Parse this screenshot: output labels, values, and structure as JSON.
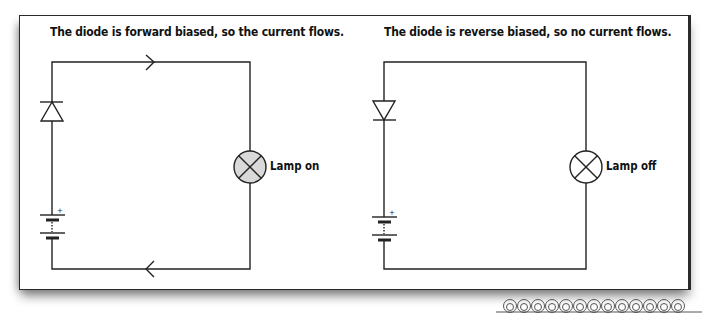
{
  "panels": [
    {
      "caption": "The diode is forward biased, so the current flows.",
      "diode_orientation": "forward",
      "lamp_label": "Lamp on",
      "lamp_state": "on",
      "lamp_fill": "#d9d9d9",
      "current_arrows": [
        "right-on-top-wire",
        "left-on-bottom-wire"
      ]
    },
    {
      "caption": "The diode is reverse biased, so no current flows.",
      "diode_orientation": "reverse",
      "lamp_label": "Lamp off",
      "lamp_state": "off",
      "lamp_fill": "#ffffff",
      "current_arrows": []
    }
  ],
  "battery": {
    "polarity_mark": "+"
  },
  "colors": {
    "wire": "#222222",
    "frame": "#2a2a2a",
    "lamp_on_fill": "#d9d9d9",
    "lamp_off_fill": "#ffffff"
  },
  "decoration": {
    "name": "coil-border",
    "loops": 13
  }
}
